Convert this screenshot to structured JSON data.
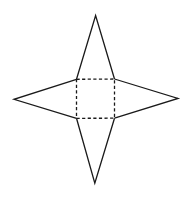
{
  "figure": {
    "colors": {
      "line": "#1a1a1a",
      "background": "#ffffff"
    },
    "base_square": {
      "style": "dashed",
      "corners": {
        "tl": [
          76.5,
          79.3
        ],
        "tr": [
          114.5,
          79.0
        ],
        "br": [
          114.5,
          118.2
        ],
        "bl": [
          76.5,
          118.3
        ]
      }
    },
    "triangles": [
      {
        "side": "top",
        "apex": [
          95.6,
          15.5
        ],
        "style": "solid"
      },
      {
        "side": "right",
        "apex": [
          178.0,
          98.4
        ],
        "style": "solid"
      },
      {
        "side": "bottom",
        "apex": [
          94.8,
          183.3
        ],
        "style": "solid"
      },
      {
        "side": "left",
        "apex": [
          14.0,
          99.3
        ],
        "style": "solid"
      }
    ]
  }
}
